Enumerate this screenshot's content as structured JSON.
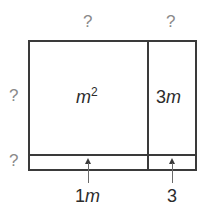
{
  "diagram": {
    "type": "area-model",
    "top_labels": {
      "left": "?",
      "right": "?"
    },
    "side_labels": {
      "top_row": "?",
      "bottom_row": "?"
    },
    "regions": {
      "top_left": {
        "base": "m",
        "exponent": "2"
      },
      "top_right": {
        "coef": "3",
        "var": "m"
      },
      "bottom_left": {
        "coef": "1",
        "var": "m"
      },
      "bottom_right": {
        "value": "3"
      }
    },
    "colors": {
      "border": "#3a3a3a",
      "question_mark": "#8a8a8a",
      "label": "#2c2c2c"
    }
  }
}
